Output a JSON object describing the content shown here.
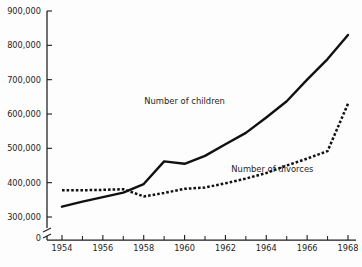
{
  "chart_data": {
    "type": "line",
    "title": "",
    "xlabel": "",
    "ylabel": "",
    "x": [
      1954,
      1955,
      1956,
      1957,
      1958,
      1959,
      1960,
      1961,
      1962,
      1963,
      1964,
      1965,
      1966,
      1967,
      1968
    ],
    "xlim": [
      1953.2,
      1968.9
    ],
    "ylim": [
      300000,
      900000
    ],
    "y_tick_values": [
      300000,
      400000,
      500000,
      600000,
      700000,
      800000,
      900000
    ],
    "y_tick_labels": [
      "300,000",
      "400,000",
      "500,000",
      "600,000",
      "700,000",
      "800,000",
      "900,000"
    ],
    "y_axis_break": true,
    "zero_label": "0",
    "x_tick_labels": [
      "1954",
      "1956",
      "1958",
      "1960",
      "1962",
      "1964",
      "1966",
      "1968"
    ],
    "x_tick_values": [
      1954,
      1956,
      1958,
      1960,
      1962,
      1964,
      1966,
      1968
    ],
    "x_minor_tick_values": [
      1955,
      1957,
      1959,
      1961,
      1963,
      1965,
      1967
    ],
    "grid": false,
    "legend_position": "inline-annotation",
    "series": [
      {
        "name": "Number of children",
        "style": "solid",
        "color": "#111111",
        "label_x": 1960.0,
        "label_y": 628000,
        "values": [
          330000,
          345000,
          358000,
          371000,
          396000,
          462000,
          455000,
          478000,
          512000,
          545000,
          590000,
          637000,
          700000,
          760000,
          830000
        ]
      },
      {
        "name": "Number of divorces",
        "style": "dotted",
        "color": "#111111",
        "label_x": 1964.3,
        "label_y": 432000,
        "values": [
          378000,
          378000,
          379000,
          381000,
          360000,
          370000,
          382000,
          386000,
          398000,
          412000,
          428000,
          450000,
          470000,
          492000,
          630000
        ]
      }
    ],
    "annotations": [
      {
        "text": "Number of children",
        "x": 1960.0,
        "y": 628000
      },
      {
        "text": "Number of divorces",
        "x": 1964.3,
        "y": 432000
      }
    ]
  },
  "labels": {
    "series_children": "Number of children",
    "series_divorces": "Number of divorces"
  },
  "colors": {
    "background": "#fdfdfd",
    "ink": "#1d1d1d",
    "line": "#111111"
  }
}
